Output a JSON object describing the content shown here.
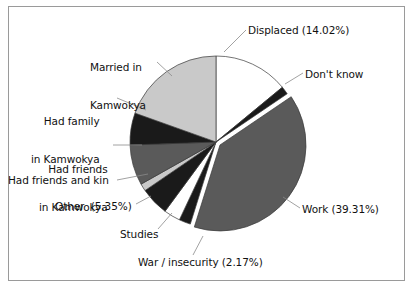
{
  "figure": {
    "border_color": "#9a9a9a",
    "background": "#ffffff"
  },
  "chart_data": {
    "type": "pie",
    "title": "",
    "xlabel": "",
    "ylabel": "",
    "legend_position": "none (direct labels with leader lines)",
    "grid": false,
    "start_angle_deg": 90,
    "direction": "clockwise",
    "categories": [
      "Displaced",
      "Don't know",
      "Work",
      "War / insecurity",
      "Studies",
      "Other",
      "Had friends and kin",
      "Had friends in Kamwokya",
      "Had family in Kamwokya",
      "Married in Kamwokya"
    ],
    "values": [
      14.02,
      1.5,
      39.31,
      2.17,
      3.1,
      5.35,
      1.4,
      7.6,
      6.0,
      19.55
    ],
    "unit": "%",
    "slices": [
      {
        "label": "Displaced",
        "value": 14.02,
        "value_text": "14.02%",
        "label_text": "Displaced (14.02%)",
        "color": "#ffffff",
        "exploded": false
      },
      {
        "label": "Don't know",
        "value": 1.5,
        "value_text": "",
        "label_text": "Don't know",
        "color": "#1a1a1a",
        "exploded": false
      },
      {
        "label": "Work",
        "value": 39.31,
        "value_text": "39.31%",
        "label_text": "Work (39.31%)",
        "color": "#5a5a5a",
        "exploded": true
      },
      {
        "label": "War / insecurity",
        "value": 2.17,
        "value_text": "2.17%",
        "label_text": "War / insecurity (2.17%)",
        "color": "#1a1a1a",
        "exploded": false
      },
      {
        "label": "Studies",
        "value": 3.1,
        "value_text": "",
        "label_text": "Studies",
        "color": "#ffffff",
        "exploded": false
      },
      {
        "label": "Other",
        "value": 5.35,
        "value_text": "5.35%",
        "label_text": "Other  (5.35%)",
        "color": "#1a1a1a",
        "exploded": false
      },
      {
        "label": "Had friends and kin",
        "value": 1.4,
        "value_text": "",
        "label_text": "Had friends and kin",
        "color": "#c9c9c9",
        "exploded": false
      },
      {
        "label": "Had friends in Kamwokya",
        "value": 7.6,
        "value_text": "",
        "label_text": "Had friends\nin Kamwokya",
        "color": "#5a5a5a",
        "exploded": false
      },
      {
        "label": "Had family in Kamwokya",
        "value": 6.0,
        "value_text": "",
        "label_text": "Had family\nin Kamwokya",
        "color": "#1a1a1a",
        "exploded": false
      },
      {
        "label": "Married in Kamwokya",
        "value": 19.55,
        "value_text": "",
        "label_text": "Married in\nKamwokya",
        "color": "#c9c9c9",
        "exploded": false
      }
    ]
  },
  "labels": {
    "displaced": "Displaced (14.02%)",
    "dont_know": "Don't know",
    "work": "Work (39.31%)",
    "war_insecurity": "War / insecurity (2.17%)",
    "studies": "Studies",
    "other": "Other  (5.35%)",
    "friends_and_kin": "Had friends and kin",
    "friends_kamwokya_line1": "Had friends",
    "friends_kamwokya_line2": "in Kamwokya",
    "family_kamwokya_line1": "Had family",
    "family_kamwokya_line2": "in Kamwokya",
    "married_kamwokya_line1": "Married in",
    "married_kamwokya_line2": "Kamwokya"
  }
}
